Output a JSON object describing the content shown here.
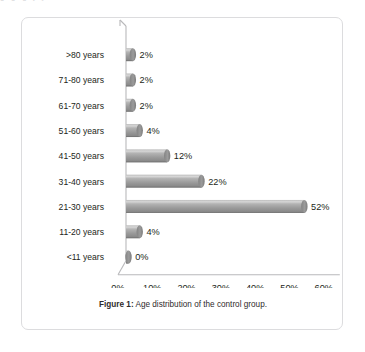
{
  "page": {
    "bleed_text": "g     g    g  j  y"
  },
  "figure": {
    "caption_label": "Figure 1",
    "caption_separator": ":",
    "caption_text": " Age distribution of the control group."
  },
  "colors": {
    "card_border": "#dcdcde",
    "bar_fill": "#9d9d9d",
    "bar_highlight": "#d2d2d2",
    "bar_shadow": "#6f6f6f",
    "bar_cap": "#7a7a7a",
    "axis": "#b9b9bb",
    "text": "#231f20",
    "background": "#ffffff"
  },
  "chart_data": {
    "type": "bar",
    "orientation": "horizontal",
    "title": "",
    "subtitle": "",
    "xlabel": "",
    "ylabel": "",
    "categories": [
      ">80 years",
      "71-80 years",
      "61-70 years",
      "51-60 years",
      "41-50 years",
      "31-40 years",
      "21-30 years",
      "11-20 years",
      "<11 years"
    ],
    "values": [
      2,
      2,
      2,
      4,
      12,
      22,
      52,
      4,
      0
    ],
    "data_labels": [
      "2%",
      "2%",
      "2%",
      "4%",
      "12%",
      "22%",
      "52%",
      "4%",
      "0%"
    ],
    "xlim": [
      0,
      60
    ],
    "xticks": [
      0,
      10,
      20,
      30,
      40,
      50,
      60
    ],
    "xticklabels": [
      "0%",
      "10%",
      "20%",
      "30%",
      "40%",
      "50%",
      "60%"
    ],
    "grid": false,
    "legend": false,
    "legend_position": "none",
    "style": "3d-cylinder",
    "series": [
      {
        "name": "Control group",
        "values": [
          2,
          2,
          2,
          4,
          12,
          22,
          52,
          4,
          0
        ]
      }
    ]
  }
}
